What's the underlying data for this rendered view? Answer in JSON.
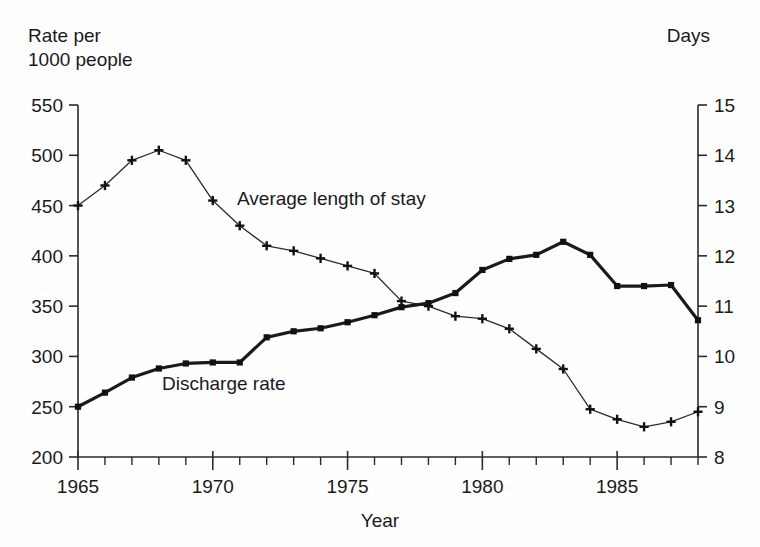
{
  "chart_data": {
    "type": "line",
    "title": "",
    "xlabel": "Year",
    "ylabel_left": "Rate per\n1000 people",
    "ylabel_left_line1": "Rate per",
    "ylabel_left_line2": "1000 people",
    "ylabel_right": "Days",
    "grid": false,
    "legend_position": "inline-annotation",
    "x": [
      1965,
      1966,
      1967,
      1968,
      1969,
      1970,
      1971,
      1972,
      1973,
      1974,
      1975,
      1976,
      1977,
      1978,
      1979,
      1980,
      1981,
      1982,
      1983,
      1984,
      1985,
      1986,
      1987,
      1988
    ],
    "xlim": [
      1965,
      1988
    ],
    "x_major_ticks": [
      1965,
      1970,
      1975,
      1980,
      1985
    ],
    "x_tick_labels": [
      "1965",
      "1970",
      "1975",
      "1980",
      "1985"
    ],
    "x_minor_tick_step": 1,
    "ylim_left": [
      200,
      550
    ],
    "y_left_ticks": [
      200,
      250,
      300,
      350,
      400,
      450,
      500,
      550
    ],
    "y_left_tick_labels": [
      "200",
      "250",
      "300",
      "350",
      "400",
      "450",
      "500",
      "550"
    ],
    "ylim_right": [
      8,
      15
    ],
    "y_right_ticks": [
      8,
      9,
      10,
      11,
      12,
      13,
      14,
      15
    ],
    "y_right_tick_labels": [
      "8",
      "9",
      "10",
      "11",
      "12",
      "13",
      "14",
      "15"
    ],
    "series": [
      {
        "name": "Discharge rate",
        "axis": "left",
        "units": "rate per 1000 people",
        "marker": "square",
        "line_weight": "thick",
        "label_text": "Discharge rate",
        "values": [
          250,
          264,
          279,
          288,
          293,
          294,
          294,
          319,
          325,
          328,
          334,
          341,
          349,
          353,
          363,
          386,
          397,
          401,
          414,
          401,
          370,
          370,
          371,
          336
        ]
      },
      {
        "name": "Average length of stay",
        "axis": "right",
        "units": "days",
        "marker": "plus",
        "line_weight": "thin",
        "label_text": "Average length of stay",
        "values": [
          13.0,
          13.4,
          13.9,
          14.1,
          13.9,
          13.1,
          12.6,
          12.2,
          12.1,
          11.95,
          11.8,
          11.65,
          11.1,
          11.0,
          10.8,
          10.75,
          10.55,
          10.15,
          9.75,
          8.95,
          8.75,
          8.6,
          8.7,
          8.9
        ]
      }
    ],
    "series_left_values_note": "discharge rate read on left axis",
    "series_right_values_note": "average length of stay read on right axis"
  },
  "annotations": {
    "stay_label": "Average length of stay",
    "discharge_label": "Discharge rate"
  },
  "colors": {
    "ink": "#1a1a1a",
    "background": "#fefefe",
    "discharge_line": "#111111",
    "stay_line": "#2b2b2b"
  }
}
